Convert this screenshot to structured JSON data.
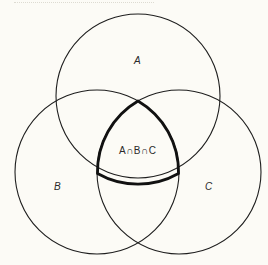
{
  "diagram": {
    "type": "venn-diagram",
    "stroke_color": "#1e1e1e",
    "background_color": "#fcfbf6",
    "sets": [
      {
        "label": "A",
        "cx": 138,
        "cy": 96,
        "r": 82
      },
      {
        "label": "B",
        "cx": 97,
        "cy": 172,
        "r": 82
      },
      {
        "label": "C",
        "cx": 179,
        "cy": 172,
        "r": 82
      }
    ],
    "intersection": {
      "label": "A∩B∩C",
      "highlight": "bold outline of triple intersection region"
    }
  }
}
